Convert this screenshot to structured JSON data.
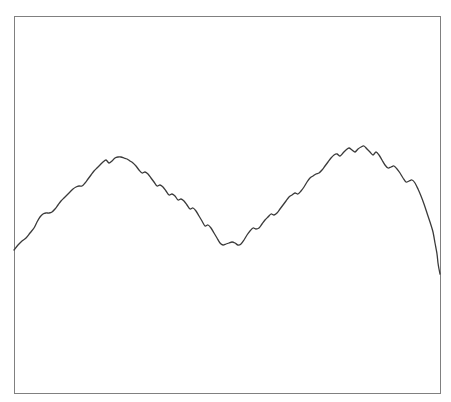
{
  "figure": {
    "background_color": "#ffffff",
    "width": 451,
    "height": 402
  },
  "frame": {
    "name": "plot-border",
    "stroke_color": "#808080",
    "stroke_width": 1.2,
    "fill": "none",
    "x": 14,
    "y": 16,
    "width": 426,
    "height": 377,
    "visible_sides": [
      "top",
      "right",
      "bottom",
      "left"
    ]
  },
  "chart_data": {
    "type": "line",
    "title": "",
    "subtitle": "",
    "xlabel": "",
    "ylabel": "",
    "grid": false,
    "legend": null,
    "annotations": [],
    "xticks": [],
    "yticks": [],
    "xlim": [
      0,
      230
    ],
    "ylim": [
      0,
      100
    ],
    "axis_visible": false,
    "series": [
      {
        "name": "signal",
        "color": "#3a3a3a",
        "line_width": 1.3,
        "marker": "none",
        "description": "Noisy double-humped curve rising from the left edge to a first broad peak, descending in a stair-step pattern to a central trough, rising again to a higher jagged second peak, then falling steeply off the right edge.",
        "points_px": [
          [
            14,
            250
          ],
          [
            18,
            245
          ],
          [
            22,
            241
          ],
          [
            26,
            238
          ],
          [
            30,
            233
          ],
          [
            34,
            228
          ],
          [
            37,
            222
          ],
          [
            40,
            217
          ],
          [
            43,
            214
          ],
          [
            46,
            213
          ],
          [
            49,
            213
          ],
          [
            52,
            212
          ],
          [
            55,
            209
          ],
          [
            58,
            205
          ],
          [
            61,
            201
          ],
          [
            64,
            198
          ],
          [
            67,
            195
          ],
          [
            70,
            192
          ],
          [
            73,
            189
          ],
          [
            76,
            187
          ],
          [
            79,
            186
          ],
          [
            82,
            186
          ],
          [
            85,
            183
          ],
          [
            88,
            179
          ],
          [
            91,
            175
          ],
          [
            94,
            171
          ],
          [
            97,
            168
          ],
          [
            100,
            165
          ],
          [
            103,
            162
          ],
          [
            106,
            160
          ],
          [
            109,
            163
          ],
          [
            112,
            161
          ],
          [
            115,
            158
          ],
          [
            118,
            157
          ],
          [
            121,
            157
          ],
          [
            124,
            158
          ],
          [
            127,
            159
          ],
          [
            130,
            161
          ],
          [
            133,
            163
          ],
          [
            136,
            166
          ],
          [
            139,
            170
          ],
          [
            142,
            173
          ],
          [
            145,
            172
          ],
          [
            148,
            174
          ],
          [
            151,
            178
          ],
          [
            154,
            182
          ],
          [
            157,
            186
          ],
          [
            160,
            185
          ],
          [
            163,
            187
          ],
          [
            166,
            191
          ],
          [
            169,
            195
          ],
          [
            172,
            194
          ],
          [
            175,
            196
          ],
          [
            178,
            200
          ],
          [
            181,
            199
          ],
          [
            184,
            201
          ],
          [
            187,
            205
          ],
          [
            190,
            209
          ],
          [
            193,
            208
          ],
          [
            196,
            211
          ],
          [
            199,
            216
          ],
          [
            202,
            221
          ],
          [
            205,
            226
          ],
          [
            208,
            225
          ],
          [
            211,
            228
          ],
          [
            214,
            233
          ],
          [
            217,
            238
          ],
          [
            220,
            243
          ],
          [
            223,
            245
          ],
          [
            226,
            244
          ],
          [
            229,
            243
          ],
          [
            232,
            242
          ],
          [
            235,
            243
          ],
          [
            238,
            245
          ],
          [
            241,
            244
          ],
          [
            244,
            240
          ],
          [
            247,
            235
          ],
          [
            250,
            231
          ],
          [
            253,
            228
          ],
          [
            256,
            229
          ],
          [
            259,
            228
          ],
          [
            262,
            224
          ],
          [
            265,
            220
          ],
          [
            268,
            217
          ],
          [
            271,
            214
          ],
          [
            274,
            215
          ],
          [
            277,
            213
          ],
          [
            280,
            209
          ],
          [
            283,
            205
          ],
          [
            286,
            201
          ],
          [
            289,
            197
          ],
          [
            292,
            195
          ],
          [
            295,
            193
          ],
          [
            298,
            194
          ],
          [
            301,
            191
          ],
          [
            304,
            187
          ],
          [
            307,
            182
          ],
          [
            310,
            178
          ],
          [
            313,
            176
          ],
          [
            316,
            174
          ],
          [
            319,
            173
          ],
          [
            322,
            170
          ],
          [
            325,
            166
          ],
          [
            328,
            162
          ],
          [
            331,
            158
          ],
          [
            334,
            155
          ],
          [
            337,
            154
          ],
          [
            340,
            156
          ],
          [
            343,
            153
          ],
          [
            346,
            150
          ],
          [
            349,
            148
          ],
          [
            352,
            150
          ],
          [
            355,
            152
          ],
          [
            358,
            149
          ],
          [
            361,
            147
          ],
          [
            364,
            146
          ],
          [
            367,
            149
          ],
          [
            370,
            152
          ],
          [
            373,
            155
          ],
          [
            376,
            152
          ],
          [
            379,
            155
          ],
          [
            382,
            160
          ],
          [
            385,
            165
          ],
          [
            388,
            168
          ],
          [
            391,
            167
          ],
          [
            394,
            166
          ],
          [
            397,
            169
          ],
          [
            400,
            173
          ],
          [
            403,
            178
          ],
          [
            406,
            182
          ],
          [
            409,
            181
          ],
          [
            412,
            180
          ],
          [
            415,
            183
          ],
          [
            418,
            189
          ],
          [
            421,
            196
          ],
          [
            424,
            204
          ],
          [
            427,
            213
          ],
          [
            430,
            222
          ],
          [
            433,
            232
          ],
          [
            435,
            243
          ],
          [
            437,
            254
          ],
          [
            438,
            263
          ],
          [
            439,
            269
          ],
          [
            440,
            274
          ]
        ],
        "key_features": {
          "start_point": [
            14,
            250
          ],
          "first_peak": [
            120,
            157
          ],
          "central_trough": [
            226,
            245
          ],
          "second_peak": [
            364,
            146
          ],
          "end_point": [
            440,
            274
          ]
        }
      }
    ]
  }
}
